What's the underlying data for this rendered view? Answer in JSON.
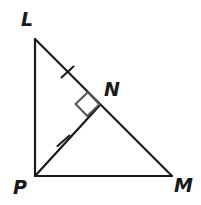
{
  "figure": {
    "type": "geometry-diagram",
    "background_color": "#ffffff",
    "stroke_color": "#1a1a1a",
    "marker_color": "#555555",
    "stroke_width": 2.2,
    "points": {
      "L": {
        "label": "L",
        "x": 35,
        "y": 39
      },
      "P": {
        "label": "P",
        "x": 35,
        "y": 176
      },
      "M": {
        "label": "M",
        "x": 172,
        "y": 176
      },
      "N": {
        "label": "N",
        "x": 100,
        "y": 105
      }
    },
    "label_positions": {
      "L": {
        "x": 21,
        "y": 10
      },
      "N": {
        "x": 104,
        "y": 80
      },
      "P": {
        "x": 13,
        "y": 178
      },
      "M": {
        "x": 174,
        "y": 176
      }
    },
    "segments": [
      {
        "name": "LP",
        "from": "L",
        "to": "P"
      },
      {
        "name": "PM",
        "from": "P",
        "to": "M"
      },
      {
        "name": "LM",
        "from": "L",
        "to": "M"
      },
      {
        "name": "PN",
        "from": "P",
        "to": "N"
      }
    ],
    "congruence_ticks": [
      {
        "name": "tick-LN",
        "on_segment": "LN",
        "x": 67,
        "y": 72,
        "count": 1
      },
      {
        "name": "tick-PN",
        "on_segment": "PN",
        "x": 63,
        "y": 141,
        "count": 1
      }
    ],
    "right_angle": {
      "name": "right-angle-at-N",
      "at_point": "N",
      "between": [
        "NL",
        "NP"
      ],
      "marker": "square",
      "size": 17
    }
  }
}
